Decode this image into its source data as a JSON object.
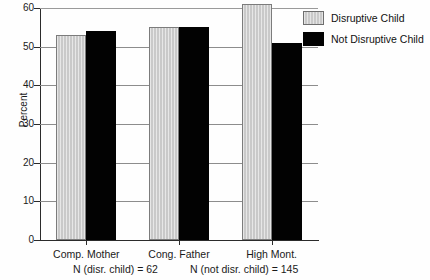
{
  "chart_data": {
    "type": "bar",
    "title": "",
    "xlabel": "",
    "ylabel": "Percent",
    "ylim": [
      0,
      60
    ],
    "yticks": [
      0,
      10,
      20,
      30,
      40,
      50,
      60
    ],
    "ytick_labels": [
      "0",
      "10",
      "20",
      "30",
      "40",
      "50",
      "60"
    ],
    "grid": true,
    "grid_axis": "y",
    "legend_position": "top-right",
    "categories": [
      "Comp. Mother",
      "Cong. Father",
      "High Mont."
    ],
    "series": [
      {
        "name": "Disruptive Child",
        "color": "#c9c9c9",
        "values": [
          53,
          55,
          61
        ]
      },
      {
        "name": "Not Disruptive Child",
        "color": "#020202",
        "values": [
          54,
          55,
          51
        ]
      }
    ],
    "annotations": [
      "N (disr. child) = 62",
      "N (not disr. child) = 145"
    ]
  },
  "legend": {
    "items": [
      {
        "label": "Disruptive Child",
        "swatch": "gray"
      },
      {
        "label": "Not Disruptive Child",
        "swatch": "black"
      }
    ]
  },
  "footnotes": {
    "left": "N (disr. child) = 62",
    "right": "N (not disr. child) = 145"
  }
}
